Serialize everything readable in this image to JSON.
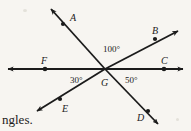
{
  "figure": {
    "background_color": "#f7f5f1",
    "line_color": "#1b1b1b",
    "vertex": {
      "label": "G",
      "x": 105,
      "y": 69
    },
    "points": [
      {
        "name": "A",
        "label": "A",
        "label_x": 70,
        "label_y": 13,
        "dot_x": 63,
        "dot_y": 24,
        "tip_x": 47,
        "tip_y": 4
      },
      {
        "name": "B",
        "label": "B",
        "label_x": 152,
        "label_y": 26,
        "dot_x": 155,
        "dot_y": 39,
        "tip_x": 183,
        "tip_y": 27
      },
      {
        "name": "C",
        "label": "C",
        "label_x": 161,
        "label_y": 56,
        "dot_x": 164,
        "dot_y": 69,
        "tip_x": 189,
        "tip_y": 69
      },
      {
        "name": "D",
        "label": "D",
        "label_x": 137,
        "label_y": 113,
        "dot_x": 148,
        "dot_y": 111,
        "tip_x": 162,
        "tip_y": 129
      },
      {
        "name": "E",
        "label": "E",
        "label_x": 62,
        "label_y": 104,
        "dot_x": 60,
        "dot_y": 99,
        "tip_x": 32,
        "tip_y": 114
      },
      {
        "name": "F",
        "label": "F",
        "label_x": 41,
        "label_y": 56,
        "dot_x": 45,
        "dot_y": 69,
        "tip_x": 2,
        "tip_y": 69
      }
    ],
    "angles": [
      {
        "name": "angle-top",
        "label": "100°",
        "value": 100,
        "unit": "degrees",
        "label_x": 103,
        "label_y": 45
      },
      {
        "name": "angle-lower-left",
        "label": "30°",
        "value": 30,
        "unit": "degrees",
        "label_x": 70,
        "label_y": 76
      },
      {
        "name": "angle-lower-right",
        "label": "50°",
        "value": 50,
        "unit": "degrees",
        "label_x": 125,
        "label_y": 76
      }
    ],
    "vertex_label_x": 101,
    "vertex_label_y": 78
  },
  "caption": {
    "text": "ngles."
  }
}
